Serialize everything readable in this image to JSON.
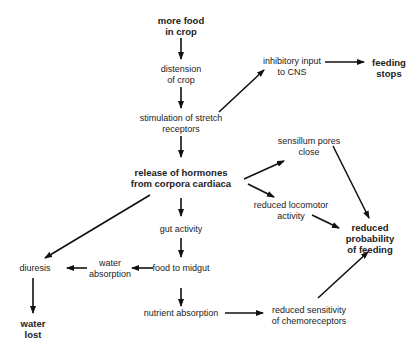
{
  "nodes": {
    "more_food": {
      "l1": "more food",
      "l2": "in crop"
    },
    "distension": {
      "l1": "distension",
      "l2": "of crop"
    },
    "stimulation": {
      "l1": "stimulation of stretch",
      "l2": "receptors"
    },
    "release": {
      "l1": "release of hormones",
      "l2": "from corpora cardiaca"
    },
    "inhibitory": {
      "l1": "inhibitory input",
      "l2": "to CNS"
    },
    "feeding_stops": {
      "l1": "feeding",
      "l2": "stops"
    },
    "sensillum": {
      "l1": "sensillum pores",
      "l2": "close"
    },
    "locomotor": {
      "l1": "reduced locomotor",
      "l2": "activity"
    },
    "reduced_prob": {
      "l1": "reduced",
      "l2": "probability",
      "l3": "of feeding"
    },
    "gut": {
      "l1": "gut activity"
    },
    "food_midgut": {
      "l1": "food to midgut"
    },
    "water_abs": {
      "l1": "water",
      "l2": "absorption"
    },
    "diuresis": {
      "l1": "diuresis"
    },
    "water_lost": {
      "l1": "water",
      "l2": "lost"
    },
    "nutrient": {
      "l1": "nutrient absorption"
    },
    "chemo": {
      "l1": "reduced sensitivity",
      "l2": "of chemoreceptors"
    }
  },
  "colors": {
    "line": "#111111",
    "text": "#222222"
  }
}
